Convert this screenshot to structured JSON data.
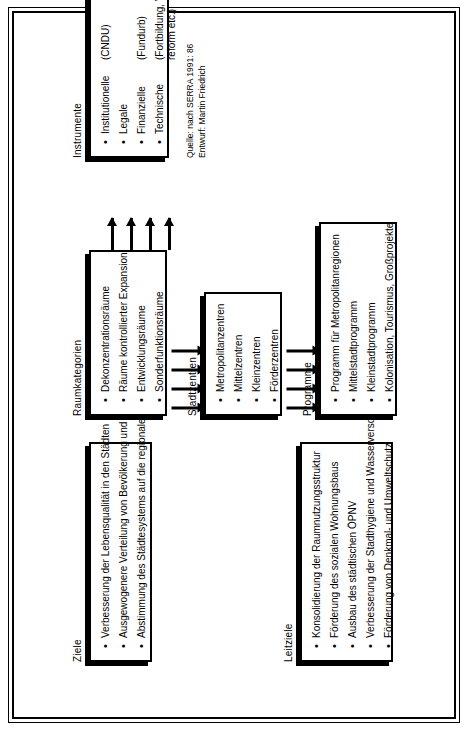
{
  "diagram": {
    "orientation": "rotated-90-ccw",
    "groups": {
      "ziele": {
        "title": "Ziele",
        "items": [
          "Verbesserung der Lebensqualität in den Städten",
          "Ausgewogenere Verteilung von Bevölkerung und Produktivkräften im Raum",
          "Abstimmung des Städtesystems auf die regionalen und sektoralen Leitziele"
        ]
      },
      "leitziele": {
        "title": "Leitziele",
        "items": [
          "Konsolidierung der Raumnutzungsstruktur",
          "Förderung des sozialen Wohnungsbaus",
          "Ausbau des städtischen ÖPNV",
          "Verbesserung der Stadthygiene und Wasserversorgung",
          "Förderung von Denkmal- und Umweltschutz"
        ]
      },
      "raumkategorien": {
        "title": "Raumkategorien",
        "items": [
          "Dekonzentrationsräume",
          "Räume kontrollierter Expansion",
          "Entwicklungsräume",
          "Sonderfunktionsräume"
        ]
      },
      "stadtzentren": {
        "title": "Stadtzentren",
        "items": [
          "Metropolitanzentren",
          "Mittelzentren",
          "Kleinzentren",
          "Förderzentren"
        ]
      },
      "programme": {
        "title": "Programme",
        "items": [
          "Programm für Metropolitanregionen",
          "Mittelstadtprogramm",
          "Kleinstadtprogramm",
          "Kolonisation, Tourismus, Großprojekte"
        ]
      },
      "instrumente": {
        "title": "Instrumente",
        "items": [
          {
            "name": "Institutionelle",
            "note": "(CNDU)"
          },
          {
            "name": "Legale",
            "note": ""
          },
          {
            "name": "Finanzielle",
            "note": "(Fundurb)"
          },
          {
            "name": "Technische",
            "note": "(Fortbildung, Verwaltungs-\nreform etc.)"
          }
        ]
      }
    },
    "credits": {
      "source": "Quelle: nach SERRA 1991: 86",
      "author": "Entwurf: Martin Friedrich"
    },
    "colors": {
      "ink": "#000000",
      "paper": "#ffffff"
    }
  }
}
